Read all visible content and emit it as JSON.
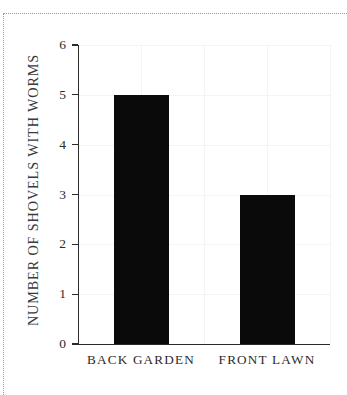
{
  "figure": {
    "background_color": "#ffffff",
    "rule_color": "#9a9a9a",
    "axis_color": "#2b2b2b",
    "bar_color": "#0a0a0a",
    "grid_color": "#f4f4f4"
  },
  "chart_data": {
    "type": "bar",
    "title": "",
    "subtitle": "",
    "xlabel": "",
    "ylabel": "NUMBER OF SHOVELS WITH WORMS",
    "categories": [
      "BACK GARDEN",
      "FRONT LAWN"
    ],
    "values": [
      5,
      3
    ],
    "series": [
      {
        "name": "number of shovels with worms",
        "values": [
          5,
          3
        ]
      }
    ],
    "ylim": [
      0,
      6
    ],
    "xlim": [
      0,
      2
    ],
    "ytick_labels": [
      "0",
      "1",
      "2",
      "3",
      "4",
      "5",
      "6"
    ],
    "ytick_values": [
      0,
      1,
      2,
      3,
      4,
      5,
      6
    ],
    "xtick_labels": [
      "BACK GARDEN",
      "FRONT LAWN"
    ],
    "grid": "faint-both",
    "legend": "none",
    "legend_position": "none",
    "annotations": [],
    "bar_color": "#0a0a0a",
    "bar_width_fraction": 0.22
  }
}
